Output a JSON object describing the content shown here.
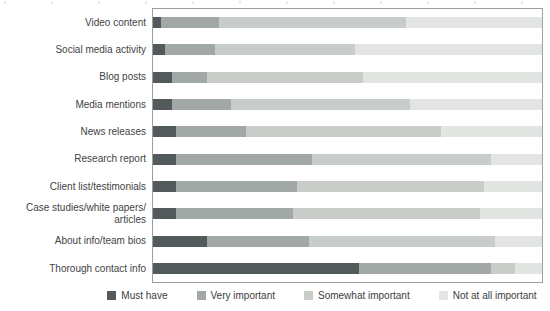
{
  "chart_data": {
    "type": "bar",
    "subtype": "horizontal-stacked-100pct",
    "title": "",
    "xlabel": "",
    "ylabel": "",
    "xlim": [
      0,
      100
    ],
    "grid": false,
    "legend_position": "bottom",
    "categories": [
      "Video content",
      "Social media activity",
      "Blog posts",
      "Media mentions",
      "News releases",
      "Research report",
      "Client list/testimonials",
      "Case studies/white papers/\narticles",
      "About info/team bios",
      "Thorough contact info"
    ],
    "series": [
      {
        "name": "Must have",
        "color": "#525a5c",
        "values": [
          2,
          3,
          5,
          5,
          6,
          6,
          6,
          6,
          14,
          53
        ]
      },
      {
        "name": "Very important",
        "color": "#a2a8a5",
        "values": [
          15,
          13,
          9,
          15,
          18,
          35,
          31,
          30,
          26,
          34
        ]
      },
      {
        "name": "Somewhat important",
        "color": "#c9cdca",
        "values": [
          48,
          36,
          40,
          46,
          50,
          46,
          48,
          48,
          48,
          6
        ]
      },
      {
        "name": "Not at all important",
        "color": "#e3e5e2",
        "values": [
          35,
          48,
          46,
          34,
          26,
          13,
          15,
          16,
          12,
          7
        ]
      }
    ],
    "plot_border_color": "#99a19f",
    "label_text_color": "#3f4345"
  }
}
